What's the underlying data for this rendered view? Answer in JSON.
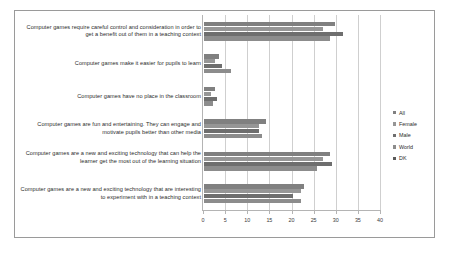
{
  "chart_data": {
    "type": "bar",
    "orientation": "horizontal",
    "title": "",
    "xlabel": "",
    "ylabel": "",
    "xlim": [
      0,
      40
    ],
    "xticks": [
      0,
      5,
      10,
      15,
      20,
      25,
      30,
      35,
      40
    ],
    "xticklabels": [
      "0",
      "5",
      "10",
      "15",
      "20",
      "25",
      "30",
      "35",
      "40"
    ],
    "grid": true,
    "legend_position": "right",
    "categories": [
      "Computer games require careful control and consideration in order to get a benefit out of them in a teaching context",
      "Computer games make it easier for pupils to learn",
      "Computer games have no place in the classroom",
      "Computer games are fun and entertaining. They can engage and motivate pupils better than other media",
      "Computer games are a new and exciting technology that can help the learner get the most out of the learning situation",
      "Computer games are a new and exciting technology that are interesting to experiment with in a teaching context"
    ],
    "series": [
      {
        "name": "All",
        "color": "#808080",
        "values": [
          29.5,
          3.5,
          2.5,
          14.0,
          28.5,
          22.5
        ]
      },
      {
        "name": "Female",
        "color": "#969696",
        "values": [
          27.0,
          2.5,
          1.5,
          12.5,
          27.0,
          22.0
        ]
      },
      {
        "name": "Male",
        "color": "#6e6e6e",
        "values": [
          31.5,
          4.0,
          3.0,
          12.5,
          29.0,
          20.0
        ]
      },
      {
        "name": "World",
        "color": "#8c8c8c",
        "values": [
          28.5,
          6.0,
          2.0,
          13.0,
          25.5,
          22.0
        ]
      },
      {
        "name": "DK",
        "color": "#5a5a5a",
        "values": [
          0,
          0,
          0,
          0,
          0,
          0
        ]
      }
    ]
  },
  "legend": {
    "items": [
      {
        "label": "All",
        "color": "#808080"
      },
      {
        "label": "Female",
        "color": "#969696"
      },
      {
        "label": "Male",
        "color": "#6e6e6e"
      },
      {
        "label": "World",
        "color": "#8c8c8c"
      },
      {
        "label": "DK",
        "color": "#5a5a5a"
      }
    ]
  }
}
